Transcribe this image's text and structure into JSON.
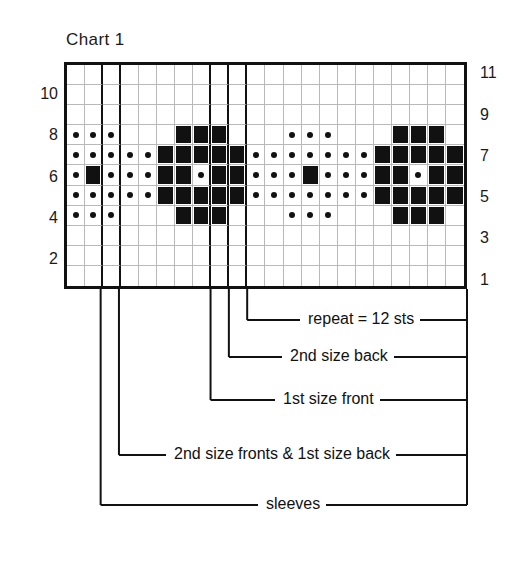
{
  "title": "Chart 1",
  "chart_data": {
    "type": "heatmap",
    "title": "Chart 1",
    "subtitle": "",
    "xlabel": "",
    "ylabel": "",
    "grid": true,
    "legend_position": "none",
    "columns": 22,
    "rows": 11,
    "row_labels_left": [
      "10",
      "8",
      "6",
      "4",
      "2"
    ],
    "row_labels_right": [
      "11",
      "9",
      "7",
      "5",
      "3",
      "1"
    ],
    "left_label_rows": [
      10,
      8,
      6,
      4,
      2
    ],
    "right_label_rows": [
      11,
      9,
      7,
      5,
      3,
      1
    ],
    "symbols": {
      "dot": "purl / contrast dot stitch",
      "fill": "solid colour block stitch",
      "empty": "background knit stitch"
    },
    "heavy_divider_after_columns": [
      2,
      3,
      8,
      9,
      10
    ],
    "cells": [
      {
        "row": 11,
        "values": [
          "",
          "",
          "",
          "",
          "",
          "",
          "",
          "",
          "",
          "",
          "",
          "",
          "",
          "",
          "",
          "",
          "",
          "",
          "",
          "",
          "",
          ""
        ]
      },
      {
        "row": 10,
        "values": [
          "",
          "",
          "",
          "",
          "",
          "",
          "",
          "",
          "",
          "",
          "",
          "",
          "",
          "",
          "",
          "",
          "",
          "",
          "",
          "",
          "",
          ""
        ]
      },
      {
        "row": 9,
        "values": [
          "",
          "",
          "",
          "",
          "",
          "",
          "",
          "",
          "",
          "",
          "",
          "",
          "",
          "",
          "",
          "",
          "",
          "",
          "",
          "",
          "",
          ""
        ]
      },
      {
        "row": 8,
        "values": [
          "dot",
          "dot",
          "dot",
          "",
          "",
          "",
          "fill",
          "fill",
          "fill",
          "",
          "",
          "",
          "dot",
          "dot",
          "dot",
          "",
          "",
          "",
          "fill",
          "fill",
          "fill",
          ""
        ]
      },
      {
        "row": 7,
        "values": [
          "dot",
          "dot",
          "dot",
          "dot",
          "dot",
          "fill",
          "fill",
          "fill",
          "fill",
          "fill",
          "dot",
          "dot",
          "dot",
          "dot",
          "dot",
          "dot",
          "dot",
          "fill",
          "fill",
          "fill",
          "fill",
          "fill"
        ]
      },
      {
        "row": 6,
        "values": [
          "dot",
          "fill",
          "dot",
          "dot",
          "dot",
          "fill",
          "fill",
          "dot",
          "fill",
          "fill",
          "dot",
          "dot",
          "dot",
          "fill",
          "dot",
          "dot",
          "dot",
          "fill",
          "fill",
          "dot",
          "fill",
          "fill"
        ]
      },
      {
        "row": 5,
        "values": [
          "dot",
          "dot",
          "dot",
          "dot",
          "dot",
          "fill",
          "fill",
          "fill",
          "fill",
          "fill",
          "dot",
          "dot",
          "dot",
          "dot",
          "dot",
          "dot",
          "dot",
          "fill",
          "fill",
          "fill",
          "fill",
          "fill"
        ]
      },
      {
        "row": 4,
        "values": [
          "dot",
          "dot",
          "dot",
          "",
          "",
          "",
          "fill",
          "fill",
          "fill",
          "",
          "",
          "",
          "dot",
          "dot",
          "dot",
          "",
          "",
          "",
          "fill",
          "fill",
          "fill",
          ""
        ]
      },
      {
        "row": 3,
        "values": [
          "",
          "",
          "",
          "",
          "",
          "",
          "",
          "",
          "",
          "",
          "",
          "",
          "",
          "",
          "",
          "",
          "",
          "",
          "",
          "",
          "",
          ""
        ]
      },
      {
        "row": 2,
        "values": [
          "",
          "",
          "",
          "",
          "",
          "",
          "",
          "",
          "",
          "",
          "",
          "",
          "",
          "",
          "",
          "",
          "",
          "",
          "",
          "",
          "",
          ""
        ]
      },
      {
        "row": 1,
        "values": [
          "",
          "",
          "",
          "",
          "",
          "",
          "",
          "",
          "",
          "",
          "",
          "",
          "",
          "",
          "",
          "",
          "",
          "",
          "",
          "",
          "",
          ""
        ]
      }
    ],
    "annotations": [
      {
        "id": "repeat",
        "label": "repeat = 12 sts",
        "start_column": 11,
        "end_column": 22
      },
      {
        "id": "second-back",
        "label": "2nd size back",
        "start_column": 10,
        "end_column": 22
      },
      {
        "id": "first-front",
        "label": "1st size  front",
        "start_column": 9,
        "end_column": 22
      },
      {
        "id": "second-fronts",
        "label": "2nd size fronts &  1st size back",
        "start_column": 4,
        "end_column": 22
      },
      {
        "id": "sleeves",
        "label": "sleeves",
        "start_column": 3,
        "end_column": 22
      }
    ]
  },
  "colors": {
    "ink": "#111111",
    "gridline": "#b9b9b9",
    "background": "#ffffff"
  }
}
